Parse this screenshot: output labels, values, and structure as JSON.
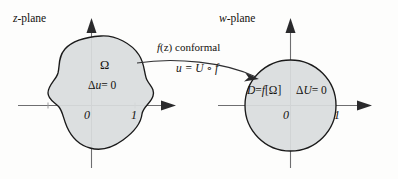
{
  "figure": {
    "caption_domain": "complex-analysis conformal mapping diagram",
    "background_color": "#fdfdfc",
    "ink_color": "#14120f",
    "axis_color": "#6e6e70",
    "region_fill": "#d9dcdd",
    "region_stroke": "#1a1a1a"
  },
  "left_plane": {
    "title_italic": "z",
    "title_rest": "-plane",
    "region_label": "Ω",
    "equation": {
      "delta": "Δ",
      "variable": "u",
      "rest": "= 0"
    },
    "ticks": [
      {
        "label": "0",
        "x": 0
      },
      {
        "label": "1",
        "x": 1
      }
    ]
  },
  "right_plane": {
    "title_italic": "w",
    "title_rest": "-plane",
    "region_label_prefix": "D",
    "region_label_eq": "=",
    "region_label_fn": "f",
    "region_label_arg": "[Ω]",
    "equation": {
      "delta": "Δ",
      "variable": "U",
      "rest": "= 0"
    },
    "ticks": [
      {
        "label": "0",
        "x": 0
      },
      {
        "label": "1",
        "x": 1
      }
    ]
  },
  "mapping_arrow": {
    "top_label_fn": "f",
    "top_label_arg": "(z)",
    "top_label_word": "conformal",
    "bottom_label": "u = U ∘ f"
  }
}
